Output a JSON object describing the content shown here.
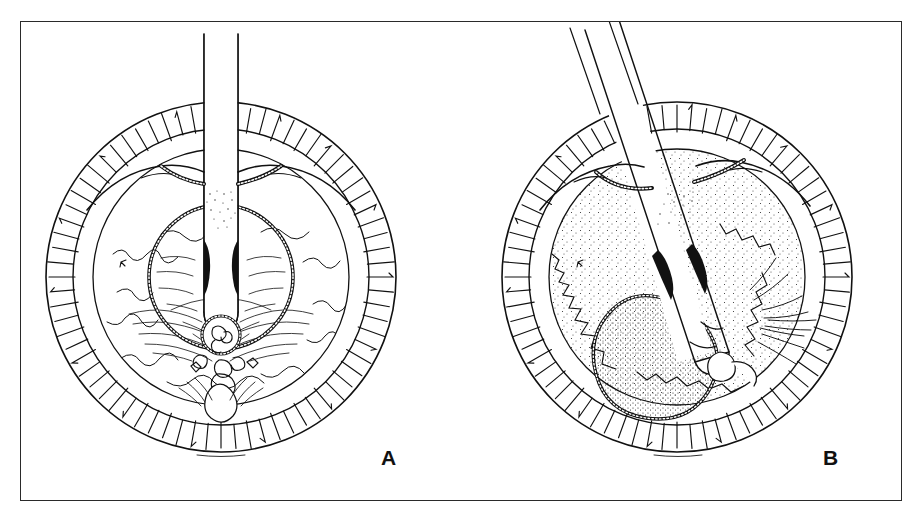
{
  "figure": {
    "background_color": "#ffffff",
    "ink_color": "#111111",
    "frame": {
      "border_color": "#2a2a2a",
      "x": 20,
      "y": 21,
      "width": 882,
      "height": 480
    }
  },
  "panels": [
    {
      "id": "A",
      "label": "A",
      "caption_position": "bottom-right",
      "instrument": {
        "name": "handpiece-probe",
        "orientation": "vertical",
        "angle_degrees": 0,
        "tip_depth": "center",
        "shaft_width_px": 34,
        "entry_point": "superior-incision"
      },
      "anatomy": {
        "outer_ring_label": "ciliary-body-ring",
        "outer_ring_hatch_count": 74,
        "middle_circle_label": "iris-pupil-margin",
        "inner_circle_label": "capsulorhexis-opening",
        "center_feature": "nucleus-fragment-cluster",
        "stipple_density": "sparse",
        "incision_style": "beaded-dotted"
      }
    },
    {
      "id": "B",
      "label": "B",
      "caption_position": "bottom-right",
      "instrument": {
        "name": "handpiece-probe",
        "orientation": "oblique",
        "angle_degrees": 28,
        "tip_depth": "mid-chamber",
        "shaft_width_px": 34,
        "entry_point": "superior-incision"
      },
      "anatomy": {
        "outer_ring_label": "ciliary-body-ring",
        "outer_ring_hatch_count": 74,
        "middle_circle_label": "iris-pupil-margin",
        "inner_circle_label": "capsulorhexis-opening",
        "center_feature": "nucleus-mass-stippled",
        "stipple_density": "dense",
        "incision_style": "beaded-dotted"
      }
    }
  ],
  "signature": {
    "text": "",
    "visible": true,
    "position": "below-outer-circle"
  }
}
